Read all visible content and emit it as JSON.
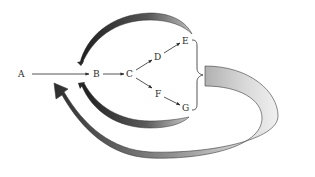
{
  "diagram": {
    "nodes": [
      {
        "id": "A",
        "label": "A",
        "x": 22,
        "y": 77
      },
      {
        "id": "B",
        "label": "B",
        "x": 97,
        "y": 77
      },
      {
        "id": "C",
        "label": "C",
        "x": 130,
        "y": 77
      },
      {
        "id": "D",
        "label": "D",
        "x": 158,
        "y": 60
      },
      {
        "id": "E",
        "label": "E",
        "x": 185,
        "y": 44
      },
      {
        "id": "F",
        "label": "F",
        "x": 158,
        "y": 96
      },
      {
        "id": "G",
        "label": "G",
        "x": 185,
        "y": 110
      }
    ],
    "edges": [
      {
        "from": "A",
        "to": "B"
      },
      {
        "from": "B",
        "to": "C"
      },
      {
        "from": "C",
        "to": "D"
      },
      {
        "from": "D",
        "to": "E"
      },
      {
        "from": "C",
        "to": "F"
      },
      {
        "from": "F",
        "to": "G"
      }
    ],
    "feedback_arrows": [
      {
        "name": "E-to-B upper curved arrow",
        "from": "E",
        "to": "B"
      },
      {
        "name": "G-to-B lower curved arrow",
        "from": "G",
        "to": "B"
      },
      {
        "name": "E-G group to A large loop arrow",
        "from": "E..G",
        "to": "A"
      }
    ],
    "colors": {
      "ink": "#2a2a2a",
      "band_dark": "#555555",
      "band_light": "#e6e6e6"
    }
  }
}
